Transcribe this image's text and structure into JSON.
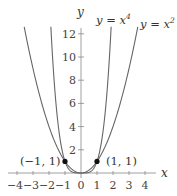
{
  "chart_data": {
    "type": "line",
    "title": "",
    "xlabel": "x",
    "ylabel": "y",
    "xlim": [
      -4.5,
      4.6
    ],
    "ylim": [
      0,
      12.5
    ],
    "grid": false,
    "x_ticks": [
      -4,
      -3,
      -2,
      -1,
      0,
      1,
      2,
      3,
      4
    ],
    "x_tick_labels": [
      "−4",
      "−3",
      "−2",
      "−1",
      "0",
      "1",
      "2",
      "3",
      "4"
    ],
    "y_ticks": [
      2,
      4,
      6,
      8,
      10,
      12
    ],
    "y_tick_labels": [
      "2",
      "4",
      "6",
      "8",
      "10",
      "12"
    ],
    "series": [
      {
        "name": "y = x^4",
        "label": "y = x⁴",
        "function": "x^4",
        "color": "#555555"
      },
      {
        "name": "y = x^2",
        "label": "y = x²",
        "function": "x^2",
        "color": "#555555"
      }
    ],
    "points": [
      {
        "x": -1,
        "y": 1,
        "label": "(−1, 1)"
      },
      {
        "x": 1,
        "y": 1,
        "label": "(1, 1)"
      }
    ],
    "annotations": [
      "y = x⁴",
      "y = x²",
      "(−1, 1)",
      "(1, 1)"
    ]
  },
  "labels": {
    "x_axis": "x",
    "y_axis": "y",
    "curve_x4_prefix": "y = x",
    "curve_x4_exp": "4",
    "curve_x2_prefix": "y = x",
    "curve_x2_exp": "2",
    "point_left": "(−1, 1)",
    "point_right": "(1, 1)"
  }
}
